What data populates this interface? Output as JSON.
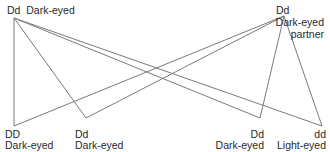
{
  "parents": {
    "left": {
      "genotype": "Dd",
      "phenotype": "Dark-eyed"
    },
    "right": {
      "genotype": "Dd",
      "phenotype": "Dark-eyed",
      "note": "partner"
    }
  },
  "offspring": [
    {
      "genotype": "DD",
      "phenotype": "Dark-eyed"
    },
    {
      "genotype": "Dd",
      "phenotype": "Dark-eyed"
    },
    {
      "genotype": "Dd",
      "phenotype": "Dark-eyed"
    },
    {
      "genotype": "dd",
      "phenotype": "Light-eyed"
    }
  ],
  "line_color": "#7a7a7a"
}
